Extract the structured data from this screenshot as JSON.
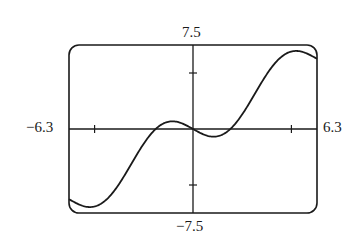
{
  "chart_data": {
    "type": "line",
    "title": "",
    "xlabel": "",
    "ylabel": "",
    "xlim": [
      -6.3,
      6.3
    ],
    "ylim": [
      -7.5,
      7.5
    ],
    "x_tick_marks": [
      -5,
      5
    ],
    "y_tick_marks": [
      -5,
      5
    ],
    "grid": false,
    "legend": null,
    "window_labels": {
      "xmin": "−6.3",
      "xmax": "6.3",
      "ymin": "−7.5",
      "ymax": "7.5"
    },
    "series": [
      {
        "name": "f(x)",
        "description": "curve consistent with y = x - 2 sin(x)",
        "x": [
          -6.3,
          -5.24,
          -4,
          -3,
          -2,
          -1.05,
          0,
          1.05,
          2,
          3,
          4,
          5.24,
          6.3
        ],
        "y": [
          -6.27,
          -6.97,
          -5.51,
          -3.28,
          -0.18,
          0.68,
          0,
          -0.68,
          0.18,
          3.28,
          5.51,
          6.97,
          6.27
        ]
      }
    ],
    "colors": {
      "line": "#1a1a1a",
      "frame": "#1a1a1a",
      "background": "#ffffff"
    }
  }
}
